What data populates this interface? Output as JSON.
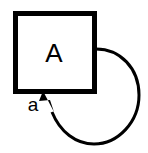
{
  "diagram": {
    "type": "state-transition-self-loop",
    "background_color": "#FFFFFF",
    "stroke_color": "#000000",
    "canvas": {
      "width": 148,
      "height": 153
    },
    "state": {
      "label": "A",
      "shape": "square",
      "x": 13,
      "y": 11,
      "width": 84,
      "height": 83,
      "border_width": 5,
      "label_x": 54,
      "label_y": 62,
      "fill_color": "#FFFFFF",
      "border_color": "#000000",
      "label_color": "#000000"
    },
    "transition": {
      "label": "a",
      "label_x": 33,
      "label_y": 111,
      "label_color": "#000000",
      "kind": "self-loop",
      "direction": "clockwise",
      "source_side": "right-edge",
      "target_side": "bottom-edge",
      "start_point": {
        "x": 96,
        "y": 49
      },
      "end_point": {
        "x": 44,
        "y": 94
      },
      "extreme_right_x": 139,
      "extreme_bottom_y": 144,
      "stroke_width": 3,
      "stroke_color": "#000000",
      "arrowhead": {
        "shape": "filled-triangle",
        "tip_x": 43,
        "tip_y": 92,
        "color": "#000000"
      }
    }
  }
}
